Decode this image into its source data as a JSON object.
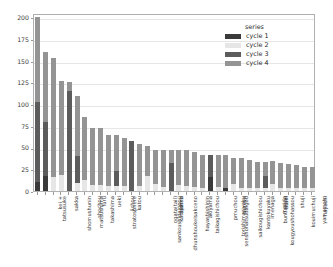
{
  "legend": {
    "title": "series",
    "entries": [
      {
        "label": "cycle 1",
        "color": "#3a3a3a"
      },
      {
        "label": "cycle 2",
        "color": "#e6e6e6"
      },
      {
        "label": "cycle 3",
        "color": "#5c5c5c"
      },
      {
        "label": "cycle 4",
        "color": "#949494"
      }
    ]
  },
  "chart_data": {
    "type": "bar",
    "title": "",
    "xlabel": "",
    "ylabel": "",
    "stacked": true,
    "orientation": "vertical",
    "grid": true,
    "grid_axis": "y",
    "legend_title": "series",
    "legend_position": "upper right",
    "ylim": [
      0,
      205
    ],
    "yticks": [
      0,
      25,
      50,
      75,
      100,
      125,
      150,
      175,
      200
    ],
    "ytick_labels": [
      "0",
      "25",
      "50",
      "75",
      "100",
      "125",
      "150",
      "175",
      "200"
    ],
    "xtick_rotation": 90,
    "categories": [
      "tatsusuke",
      "kei +",
      "shomushunin",
      "sakka",
      "matsushima",
      "shochou",
      "takashima",
      "furu",
      "stratosphere",
      "ueki",
      "jichou",
      "katou",
      "sankoushidaigpou",
      "dhunshoukeisakceno",
      "ogata(tail)",
      "katayama",
      "tashiro",
      "hayashishinin",
      "taikagishichou",
      "akiyama",
      "senshohatsudaigou",
      "torishimariyaku",
      "pmuchou",
      "saikougishichou",
      "tamiya",
      "kantokuyaku",
      "kougyoushohassou",
      "imenaga",
      "bundaigou",
      "marida",
      "araki",
      "kouimuchuji",
      "shuji",
      "yamamoto",
      "hayashi",
      "yamakana"
    ],
    "series": [
      {
        "name": "cycle 1",
        "color": "#3a3a3a",
        "values": [
          10,
          17,
          0,
          0,
          0,
          0,
          0,
          0,
          0,
          0,
          0,
          0,
          0,
          0,
          0,
          0,
          0,
          0,
          0,
          0,
          0,
          0,
          16,
          0,
          4,
          0,
          0,
          0,
          0,
          0,
          0,
          0,
          0,
          0,
          0,
          0
        ]
      },
      {
        "name": "cycle 2",
        "color": "#e6e6e6",
        "values": [
          0,
          0,
          16,
          18,
          0,
          9,
          13,
          7,
          7,
          6,
          6,
          6,
          0,
          6,
          17,
          8,
          5,
          0,
          7,
          6,
          5,
          4,
          0,
          5,
          0,
          8,
          3,
          3,
          3,
          3,
          8,
          3,
          3,
          3,
          3,
          3
        ]
      },
      {
        "name": "cycle 3",
        "color": "#5c5c5c",
        "values": [
          93,
          63,
          0,
          0,
          115,
          31,
          0,
          0,
          0,
          0,
          17,
          0,
          58,
          0,
          0,
          0,
          0,
          32,
          0,
          0,
          0,
          0,
          25,
          0,
          0,
          0,
          0,
          0,
          0,
          14,
          0,
          0,
          0,
          0,
          0,
          0
        ]
      },
      {
        "name": "cycle 4",
        "color": "#949494",
        "values": [
          97,
          80,
          137,
          109,
          10,
          70,
          72,
          65,
          65,
          58,
          41,
          55,
          0,
          48,
          35,
          39,
          42,
          15,
          40,
          41,
          40,
          37,
          0,
          37,
          38,
          30,
          35,
          33,
          31,
          17,
          26,
          29,
          28,
          27,
          25,
          25
        ]
      }
    ],
    "totals": [
      200,
      160,
      153,
      127,
      125,
      110,
      85,
      72,
      72,
      64,
      64,
      61,
      58,
      54,
      52,
      47,
      47,
      47,
      47,
      47,
      45,
      41,
      41,
      42,
      42,
      38,
      38,
      36,
      34,
      34,
      34,
      32,
      31,
      30,
      28,
      28
    ]
  }
}
